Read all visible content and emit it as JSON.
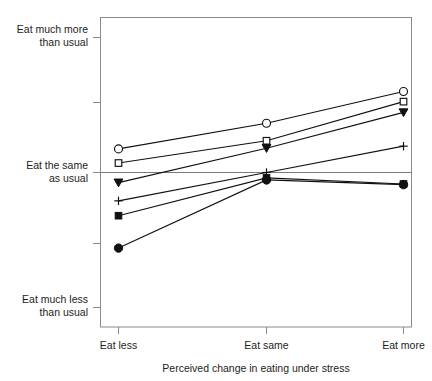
{
  "chart_data": {
    "type": "line",
    "title": "",
    "xlabel": "Perceived change in eating under stress",
    "ylabel": "",
    "categories": [
      "Eat less",
      "Eat same",
      "Eat more"
    ],
    "x": [
      1,
      2,
      3
    ],
    "grid": false,
    "legend": "none",
    "ylim": [
      1,
      5
    ],
    "xlim": [
      0.7,
      3.3
    ],
    "ytick_values": [
      5,
      4,
      3,
      2,
      1
    ],
    "ytick_labels": [
      "Eat much more\nthan usual",
      "",
      "Eat the same\nas usual",
      "",
      "Eat much less\nthan usual"
    ],
    "reference_line_y": 3,
    "series": [
      {
        "name": "series-1",
        "marker": "open-circle",
        "values": [
          3.35,
          3.73,
          4.2
        ]
      },
      {
        "name": "series-2",
        "marker": "open-square",
        "values": [
          3.14,
          3.47,
          4.05
        ]
      },
      {
        "name": "series-3",
        "marker": "filled-triangle",
        "values": [
          2.85,
          3.36,
          3.89
        ]
      },
      {
        "name": "series-4",
        "marker": "plus",
        "values": [
          2.58,
          3.0,
          3.39
        ]
      },
      {
        "name": "series-5",
        "marker": "filled-square",
        "values": [
          2.36,
          2.92,
          2.83
        ]
      },
      {
        "name": "series-6",
        "marker": "filled-circle",
        "values": [
          1.88,
          2.89,
          2.82
        ]
      }
    ]
  },
  "axes": {
    "y_labels": [
      {
        "line1": "Eat much more",
        "line2": "than usual"
      },
      {
        "line1": "Eat the same",
        "line2": "as usual"
      },
      {
        "line1": "Eat much less",
        "line2": "than usual"
      }
    ],
    "x_labels": [
      "Eat less",
      "Eat same",
      "Eat more"
    ],
    "x_axis_title": "Perceived change in eating under stress"
  },
  "colors": {
    "ink": "#111111",
    "frame": "#8a8a8a",
    "background": "#ffffff"
  }
}
